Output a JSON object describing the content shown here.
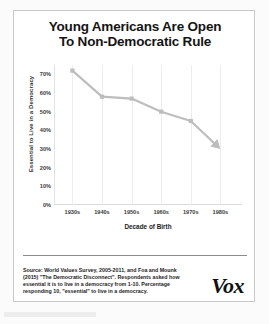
{
  "card": {
    "title_line1": "Young Americans Are Open",
    "title_line2": "To Non-Democratic Rule",
    "brand": "Vox",
    "source_note": "Source: World Values Survey, 2005-2011, and Foa and Mounk (2015) \"The Democratic Disconnect\". Respondents asked how essential it is to live in a democracy from 1-10. Percentage responding 10, \"essential\" to live in a democracy."
  },
  "chart_data": {
    "type": "line",
    "title": "Young Americans Are Open To Non-Democratic Rule",
    "xlabel": "Decade of Birth",
    "ylabel": "Essential to Live in a Democracy",
    "categories": [
      "1930s",
      "1940s",
      "1950s",
      "1960s",
      "1970s",
      "1980s"
    ],
    "values": [
      72,
      58,
      57,
      50,
      45,
      30
    ],
    "ylim": [
      0,
      75
    ],
    "ytick_labels": [
      "0%",
      "10%",
      "20%",
      "30%",
      "40%",
      "50%",
      "60%",
      "70%"
    ],
    "ytick_values": [
      0,
      10,
      20,
      30,
      40,
      50,
      60,
      70
    ],
    "grid": "vertical",
    "legend": "none",
    "series_color": "#bdbdbd",
    "marker": "square",
    "line_end": "arrow"
  }
}
